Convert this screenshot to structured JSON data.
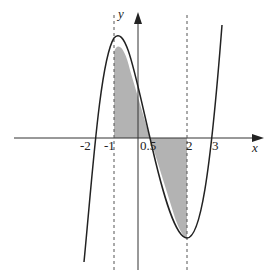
{
  "diagram": {
    "type": "cubic function graph with shaded area",
    "axis_labels": {
      "x": "x",
      "y": "y"
    },
    "tick_labels": [
      "-2",
      "-1",
      "0.5",
      "2",
      "3"
    ],
    "shaded_region": {
      "from": -1,
      "to": 2
    },
    "colors": {
      "shade": "#b3b3b3",
      "line": "#222222"
    }
  }
}
